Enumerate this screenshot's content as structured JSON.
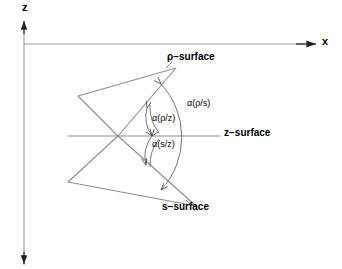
{
  "figure": {
    "background_color": "#ffffff",
    "line_color": "#808080",
    "text_color": "#000000",
    "axes": {
      "vertical": {
        "name": "z-axis",
        "label": "z",
        "direction": "up and down",
        "x": 24,
        "y_top": 22,
        "y_bottom": 265
      },
      "horizontal": {
        "name": "x-axis",
        "label": "x",
        "direction": "right",
        "y": 44,
        "x_start": 24,
        "x_end": 316
      }
    },
    "surfaces": [
      {
        "id": "rho-surface",
        "label": "ρ−surface",
        "orientation": "diagonal-up-right",
        "from": [
          78,
          96
        ],
        "to": [
          176,
          68
        ]
      },
      {
        "id": "z-surface",
        "label": "z−surface",
        "orientation": "horizontal",
        "from": [
          68,
          136
        ],
        "to": [
          220,
          136
        ]
      },
      {
        "id": "s-surface",
        "label": "s−surface",
        "orientation": "diagonal-down-right",
        "from": [
          68,
          182
        ],
        "to": [
          196,
          206
        ]
      }
    ],
    "intersection_point": [
      118,
      136
    ],
    "angles": [
      {
        "id": "alpha-rho-s",
        "label": "α(ρ/s)",
        "between": [
          "rho-surface",
          "s-surface"
        ],
        "arc": "outer"
      },
      {
        "id": "alpha-rho-z",
        "label": "α(ρ/z)",
        "between": [
          "rho-surface",
          "z-surface"
        ],
        "arc": "inner-upper"
      },
      {
        "id": "alpha-s-z",
        "label": "α(s/z)",
        "between": [
          "s-surface",
          "z-surface"
        ],
        "arc": "inner-lower"
      }
    ]
  }
}
